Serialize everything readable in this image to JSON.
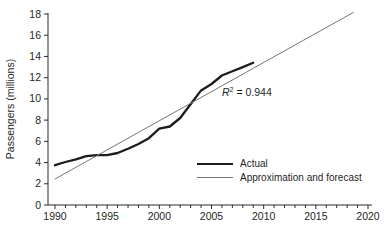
{
  "chart_data": {
    "type": "line",
    "title": "",
    "xlabel": "",
    "ylabel": "Passengers (millions)",
    "xlim": [
      1990,
      2020
    ],
    "ylim": [
      0,
      18
    ],
    "x_ticks": [
      1990,
      1995,
      2000,
      2005,
      2010,
      2015,
      2020
    ],
    "y_ticks": [
      0,
      2,
      4,
      6,
      8,
      10,
      12,
      14,
      16,
      18
    ],
    "grid": "off",
    "legend_position": "inside-bottom-right",
    "annotation": {
      "symbol": "R",
      "exponent": "2",
      "rest": " = 0.944",
      "x": 2006.5,
      "y": 10.5
    },
    "axis_color": "#2b2b2b",
    "series": [
      {
        "name": "Actual",
        "color": "#1c1c1c",
        "width": 2.3,
        "x": [
          1990,
          1991,
          1992,
          1993,
          1994,
          1995,
          1996,
          1997,
          1998,
          1999,
          2000,
          2001,
          2002,
          2003,
          2004,
          2005,
          2006,
          2007,
          2008,
          2009
        ],
        "values": [
          3.75,
          4.05,
          4.3,
          4.6,
          4.7,
          4.7,
          4.9,
          5.3,
          5.75,
          6.3,
          7.2,
          7.4,
          8.2,
          9.5,
          10.8,
          11.4,
          12.2,
          12.6,
          13.0,
          13.4
        ]
      },
      {
        "name": "Approximation and forecast",
        "color": "#767676",
        "width": 1,
        "x": [
          1990,
          2018.6
        ],
        "values": [
          2.45,
          18.15
        ]
      }
    ]
  }
}
